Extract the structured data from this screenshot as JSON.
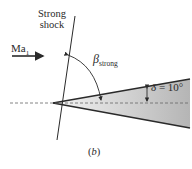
{
  "figure": {
    "shock_label_line1": "Strong",
    "shock_label_line2": "shock",
    "upstream_mach": "Ma",
    "upstream_mach_sub": "1",
    "shock_angle_symbol": "β",
    "shock_angle_sub": "strong",
    "deflection_symbol": "δ",
    "deflection_value": " = 10°",
    "caption_open": "(",
    "caption_letter": "b",
    "caption_close": ")",
    "colors": {
      "line": "#2a2a2a",
      "wedge_fill_light": "#f2f2f2",
      "wedge_fill_dark": "#b8b8b8",
      "centerline": "#666666"
    }
  }
}
